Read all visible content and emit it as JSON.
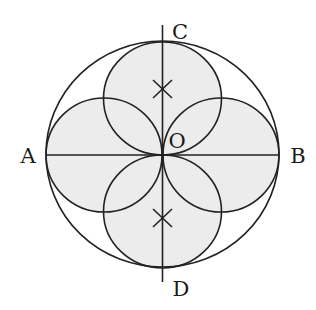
{
  "diagram": {
    "type": "geometry",
    "colors": {
      "stroke": "#222222",
      "shade": "#ececec",
      "background": "#ffffff"
    },
    "labels": {
      "A": "A",
      "B": "B",
      "C": "C",
      "D": "D",
      "O": "O"
    },
    "marks": [
      {
        "name": "top-center-mark",
        "symbol": "×"
      },
      {
        "name": "bottom-center-mark",
        "symbol": "×"
      }
    ]
  }
}
